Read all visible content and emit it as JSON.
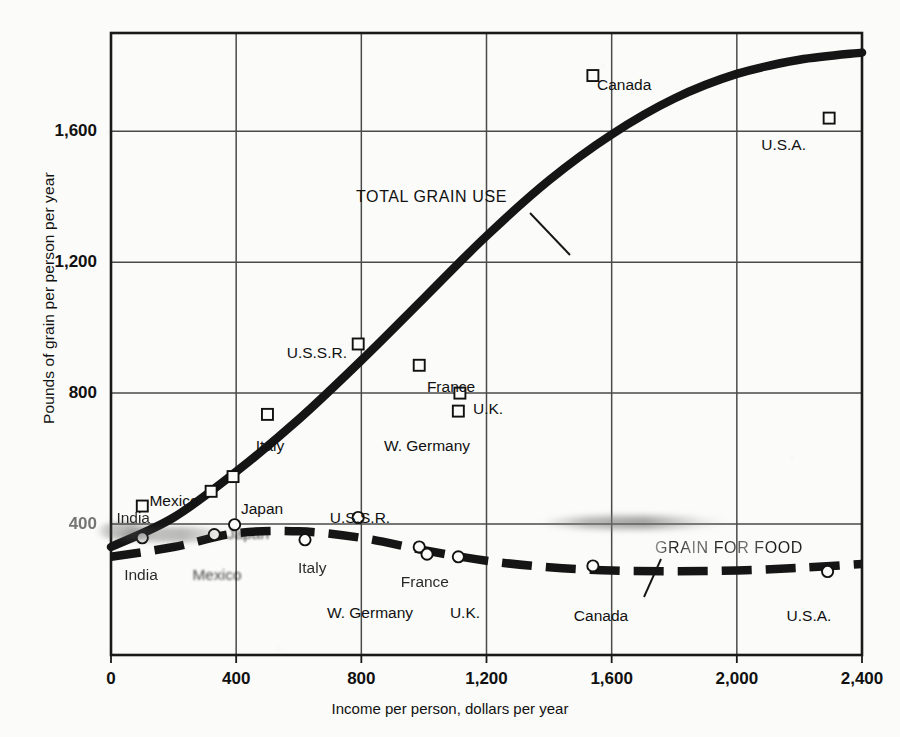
{
  "chart_data": {
    "type": "scatter",
    "title": "",
    "xlabel": "Income per person, dollars per year",
    "ylabel": "Pounds of grain per person per year",
    "xlim": [
      0,
      2400
    ],
    "ylim": [
      0,
      1900
    ],
    "xticks": [
      "0",
      "400",
      "800",
      "1,200",
      "1,600",
      "2,000",
      "2,400"
    ],
    "xtick_values": [
      0,
      400,
      800,
      1200,
      1600,
      2000,
      2400
    ],
    "yticks": [
      "400",
      "800",
      "1,200",
      "1,600"
    ],
    "ytick_values": [
      400,
      800,
      1200,
      1600
    ],
    "grid": true,
    "legend_position": "inline-annotation",
    "series": [
      {
        "name": "TOTAL GRAIN USE",
        "marker": "square",
        "line": "solid-thick",
        "annotation": "TOTAL GRAIN USE",
        "points": [
          {
            "label": "India",
            "x": 100,
            "y": 455,
            "label_pos": "left"
          },
          {
            "label": "Mexico",
            "x": 320,
            "y": 500,
            "label_pos": "above-left"
          },
          {
            "label": "Japan",
            "x": 390,
            "y": 545,
            "label_pos": "right"
          },
          {
            "label": "Italy",
            "x": 500,
            "y": 735,
            "label_pos": "below"
          },
          {
            "label": "U.S.S.R.",
            "x": 790,
            "y": 950,
            "label_pos": "left"
          },
          {
            "label": "France",
            "x": 985,
            "y": 885,
            "label_pos": "below"
          },
          {
            "label": "W. Germany",
            "x": 1110,
            "y": 745,
            "label_pos": "below"
          },
          {
            "label": "U.K.",
            "x": 1115,
            "y": 800,
            "label_pos": "right"
          },
          {
            "label": "Canada",
            "x": 1540,
            "y": 1770,
            "label_pos": "right"
          },
          {
            "label": "U.S.A.",
            "x": 2295,
            "y": 1640,
            "label_pos": "left"
          }
        ],
        "curve": [
          {
            "x": 0,
            "y": 330
          },
          {
            "x": 200,
            "y": 420
          },
          {
            "x": 400,
            "y": 560
          },
          {
            "x": 600,
            "y": 720
          },
          {
            "x": 800,
            "y": 900
          },
          {
            "x": 1000,
            "y": 1090
          },
          {
            "x": 1200,
            "y": 1280
          },
          {
            "x": 1400,
            "y": 1450
          },
          {
            "x": 1600,
            "y": 1590
          },
          {
            "x": 1800,
            "y": 1700
          },
          {
            "x": 2000,
            "y": 1775
          },
          {
            "x": 2200,
            "y": 1818
          },
          {
            "x": 2400,
            "y": 1840
          }
        ]
      },
      {
        "name": "GRAIN FOR FOOD",
        "marker": "circle",
        "line": "dashed-thick",
        "annotation": "GRAIN FOR FOOD",
        "points": [
          {
            "label": "India",
            "x": 100,
            "y": 358,
            "label_pos": "below"
          },
          {
            "label": "Mexico",
            "x": 330,
            "y": 368,
            "label_pos": "below"
          },
          {
            "label": "Japan",
            "x": 395,
            "y": 398,
            "label_pos": "above"
          },
          {
            "label": "Italy",
            "x": 620,
            "y": 352,
            "label_pos": "right"
          },
          {
            "label": "U.S.S.R.",
            "x": 790,
            "y": 420,
            "label_pos": "above"
          },
          {
            "label": "France",
            "x": 985,
            "y": 330,
            "label_pos": "left"
          },
          {
            "label": "W. Germany",
            "x": 1010,
            "y": 308,
            "label_pos": "below"
          },
          {
            "label": "U.K.",
            "x": 1110,
            "y": 300,
            "label_pos": "below"
          },
          {
            "label": "Canada",
            "x": 1540,
            "y": 272,
            "label_pos": "below"
          },
          {
            "label": "U.S.A.",
            "x": 2290,
            "y": 255,
            "label_pos": "below"
          }
        ],
        "curve": [
          {
            "x": 0,
            "y": 300
          },
          {
            "x": 200,
            "y": 330
          },
          {
            "x": 400,
            "y": 372
          },
          {
            "x": 600,
            "y": 378
          },
          {
            "x": 800,
            "y": 358
          },
          {
            "x": 1000,
            "y": 320
          },
          {
            "x": 1200,
            "y": 288
          },
          {
            "x": 1400,
            "y": 268
          },
          {
            "x": 1600,
            "y": 258
          },
          {
            "x": 1800,
            "y": 256
          },
          {
            "x": 2000,
            "y": 258
          },
          {
            "x": 2200,
            "y": 266
          },
          {
            "x": 2400,
            "y": 278
          }
        ]
      }
    ],
    "colors": {
      "ink": "#111111",
      "frame": "#1a1a1a",
      "grid": "#4a4a4a",
      "paper": "#fbfbf9"
    }
  },
  "axis": {
    "x_title": "Income per person, dollars per year",
    "y_title": "Pounds of grain per person per year",
    "x_ticks": [
      "0",
      "400",
      "800",
      "1,200",
      "1,600",
      "2,000",
      "2,400"
    ],
    "y_ticks": [
      "400",
      "800",
      "1,200",
      "1,600"
    ]
  },
  "annotations": {
    "total_grain_use": "TOTAL GRAIN USE",
    "grain_for_food": "GRAIN FOR FOOD"
  },
  "point_labels": {
    "total": {
      "india": "India",
      "mexico": "Mexico",
      "japan": "Japan",
      "italy": "Italy",
      "ussr": "U.S.S.R.",
      "france": "France",
      "wgermany": "W. Germany",
      "uk": "U.K.",
      "canada": "Canada",
      "usa": "U.S.A."
    },
    "food": {
      "india": "India",
      "mexico": "Mexico",
      "japan": "Japan",
      "italy": "Italy",
      "ussr": "U.S.S.R.",
      "france": "France",
      "wgermany": "W. Germany",
      "uk": "U.K.",
      "canada": "Canada",
      "usa": "U.S.A."
    }
  }
}
